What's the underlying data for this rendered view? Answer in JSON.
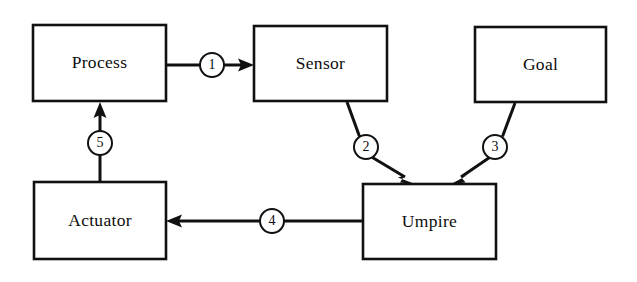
{
  "diagram": {
    "background_color": "#ffffff",
    "line_color": "#111111",
    "nodes": [
      {
        "id": "process",
        "label": "Process",
        "x": 33,
        "y": 25,
        "w": 133,
        "h": 76
      },
      {
        "id": "sensor",
        "label": "Sensor",
        "x": 254,
        "y": 26,
        "w": 133,
        "h": 75
      },
      {
        "id": "goal",
        "label": "Goal",
        "x": 475,
        "y": 27,
        "w": 131,
        "h": 75
      },
      {
        "id": "actuator",
        "label": "Actuator",
        "x": 34,
        "y": 182,
        "w": 132,
        "h": 77
      },
      {
        "id": "umpire",
        "label": "Umpire",
        "x": 363,
        "y": 184,
        "w": 133,
        "h": 75
      }
    ],
    "edges": [
      {
        "id": "edge-1",
        "label": "1",
        "from": "process",
        "to": "sensor",
        "marker_x": 212,
        "marker_y": 65
      },
      {
        "id": "edge-2",
        "label": "2",
        "from": "sensor",
        "to": "umpire",
        "marker_x": 366,
        "marker_y": 147
      },
      {
        "id": "edge-3",
        "label": "3",
        "from": "goal",
        "to": "umpire",
        "marker_x": 495,
        "marker_y": 147
      },
      {
        "id": "edge-4",
        "label": "4",
        "from": "umpire",
        "to": "actuator",
        "marker_x": 272,
        "marker_y": 221
      },
      {
        "id": "edge-5",
        "label": "5",
        "from": "actuator",
        "to": "process",
        "marker_x": 100,
        "marker_y": 143
      }
    ]
  }
}
